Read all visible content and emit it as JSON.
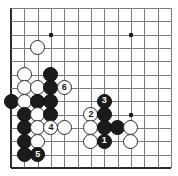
{
  "board": {
    "title": "Go board diagram",
    "grid": {
      "cols": 12,
      "rows": 12,
      "x0": 11,
      "y0": 8,
      "step_x": 13.33,
      "step_y": 13.33,
      "left_edge_col": 0,
      "bottom_edge_row": 12,
      "line_color": "#7a7a7a",
      "edge_color": "#2b2b2b",
      "background": "#ffffff"
    },
    "star_points": [
      {
        "col": 3,
        "row": 2
      },
      {
        "col": 9,
        "row": 2
      },
      {
        "col": 9,
        "row": 8
      }
    ],
    "stones": [
      {
        "col": 2,
        "row": 3,
        "color": "w",
        "label": ""
      },
      {
        "col": 1,
        "row": 5,
        "color": "w",
        "label": ""
      },
      {
        "col": 3,
        "row": 5,
        "color": "b",
        "label": ""
      },
      {
        "col": 1,
        "row": 6,
        "color": "w",
        "label": ""
      },
      {
        "col": 2,
        "row": 6,
        "color": "w",
        "label": ""
      },
      {
        "col": 3,
        "row": 6,
        "color": "b",
        "label": ""
      },
      {
        "col": 4,
        "row": 6,
        "color": "w",
        "label": "6"
      },
      {
        "col": 0,
        "row": 7,
        "color": "b",
        "label": ""
      },
      {
        "col": 1,
        "row": 7,
        "color": "w",
        "label": ""
      },
      {
        "col": 2,
        "row": 7,
        "color": "b",
        "label": ""
      },
      {
        "col": 3,
        "row": 7,
        "color": "b",
        "label": ""
      },
      {
        "col": 7,
        "row": 7,
        "color": "b",
        "label": "3"
      },
      {
        "col": 1,
        "row": 8,
        "color": "b",
        "label": ""
      },
      {
        "col": 2,
        "row": 8,
        "color": "w",
        "label": ""
      },
      {
        "col": 3,
        "row": 8,
        "color": "b",
        "label": ""
      },
      {
        "col": 6,
        "row": 8,
        "color": "w",
        "label": "2"
      },
      {
        "col": 7,
        "row": 8,
        "color": "b",
        "label": ""
      },
      {
        "col": 1,
        "row": 9,
        "color": "b",
        "label": ""
      },
      {
        "col": 2,
        "row": 9,
        "color": "w",
        "label": ""
      },
      {
        "col": 3,
        "row": 9,
        "color": "w",
        "label": "4"
      },
      {
        "col": 4,
        "row": 9,
        "color": "w",
        "label": ""
      },
      {
        "col": 6,
        "row": 9,
        "color": "w",
        "label": ""
      },
      {
        "col": 7,
        "row": 9,
        "color": "b",
        "label": ""
      },
      {
        "col": 8,
        "row": 9,
        "color": "b",
        "label": ""
      },
      {
        "col": 9,
        "row": 9,
        "color": "w",
        "label": ""
      },
      {
        "col": 1,
        "row": 10,
        "color": "b",
        "label": ""
      },
      {
        "col": 2,
        "row": 10,
        "color": "w",
        "label": ""
      },
      {
        "col": 6,
        "row": 10,
        "color": "w",
        "label": ""
      },
      {
        "col": 7,
        "row": 10,
        "color": "b",
        "label": "1"
      },
      {
        "col": 9,
        "row": 10,
        "color": "w",
        "label": ""
      },
      {
        "col": 1,
        "row": 11,
        "color": "b",
        "label": ""
      },
      {
        "col": 2,
        "row": 11,
        "color": "b",
        "label": "5"
      }
    ],
    "move_labels": [
      "1",
      "2",
      "3",
      "4",
      "5",
      "6"
    ],
    "colors": {
      "black_stone": "#1b1b1b",
      "white_stone": "#fdfdfd",
      "stone_outline": "#2a2a2a",
      "black_label_text": "#ffffff",
      "white_label_text": "#1a1a1a"
    }
  }
}
